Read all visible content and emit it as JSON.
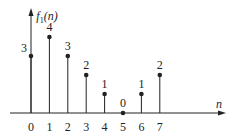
{
  "chart_data": {
    "type": "stem",
    "title": "",
    "xlabel": "n",
    "ylabel": "f1(n)",
    "ylabel_display": {
      "base": "f",
      "subscript": "1",
      "arg": "(n)"
    },
    "x": [
      0,
      1,
      2,
      3,
      4,
      5,
      6,
      7
    ],
    "values": [
      3,
      4,
      3,
      2,
      1,
      0,
      1,
      2
    ],
    "value_labels": [
      "3",
      "4",
      "3",
      "2",
      "1",
      "0",
      "1",
      "2"
    ],
    "tick_labels": [
      "0",
      "1",
      "2",
      "3",
      "4",
      "5",
      "6",
      "7"
    ],
    "grid": false,
    "legend": null,
    "ylim": [
      0,
      4
    ],
    "xlim": [
      -1,
      9
    ]
  },
  "colors": {
    "stroke": "#222222",
    "background": "#ffffff"
  }
}
